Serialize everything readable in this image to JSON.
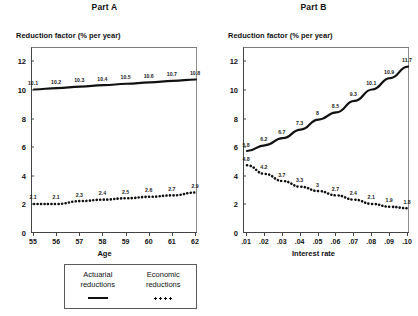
{
  "figure": {
    "y_axis_title": "Reduction factor (% per year)",
    "legend": {
      "actuarial_line1": "Actuarial",
      "actuarial_line2": "reductions",
      "economic_line1": "Economic",
      "economic_line2": "reductions",
      "actuarial_style": "solid-line",
      "economic_style": "dotted-line"
    }
  },
  "chart_data": [
    {
      "type": "line",
      "title": "Part A",
      "xlabel": "Age",
      "ylabel": "Reduction factor (% per year)",
      "categories": [
        "55",
        "56",
        "57",
        "58",
        "59",
        "60",
        "61",
        "62"
      ],
      "xlim": [
        55,
        62
      ],
      "ylim": [
        0,
        13
      ],
      "yticks": [
        "0",
        "2",
        "4",
        "6",
        "8",
        "10",
        "12"
      ],
      "ytick_values": [
        0,
        2,
        4,
        6,
        8,
        10,
        12
      ],
      "grid": false,
      "legend_position": "below-figure",
      "series": [
        {
          "name": "Actuarial reductions",
          "style": "solid",
          "values": [
            10.1,
            10.2,
            10.3,
            10.4,
            10.5,
            10.6,
            10.7,
            10.8
          ],
          "labels": [
            "10.1",
            "10.2",
            "10.3",
            "10.4",
            "10.5",
            "10.6",
            "10.7",
            "10.8"
          ]
        },
        {
          "name": "Economic reductions",
          "style": "dotted",
          "values": [
            2.1,
            2.1,
            2.3,
            2.4,
            2.5,
            2.6,
            2.7,
            2.9
          ],
          "labels": [
            "2.1",
            "2.1",
            "2.3",
            "2.4",
            "2.5",
            "2.6",
            "2.7",
            "2.9"
          ]
        }
      ]
    },
    {
      "type": "line",
      "title": "Part B",
      "xlabel": "Interest rate",
      "ylabel": "Reduction factor (% per year)",
      "categories": [
        ".01",
        ".02",
        ".03",
        ".04",
        ".05",
        ".06",
        ".07",
        ".08",
        ".09",
        ".10"
      ],
      "xlim": [
        0.01,
        0.1
      ],
      "ylim": [
        0,
        13
      ],
      "yticks": [
        "0",
        "2",
        "4",
        "6",
        "8",
        "10",
        "12"
      ],
      "ytick_values": [
        0,
        2,
        4,
        6,
        8,
        10,
        12
      ],
      "grid": false,
      "legend_position": "below-figure",
      "series": [
        {
          "name": "Actuarial reductions",
          "style": "solid",
          "values": [
            5.8,
            6.2,
            6.7,
            7.3,
            8.0,
            8.5,
            9.3,
            10.1,
            10.9,
            11.7
          ],
          "labels": [
            "5.8",
            "6.2",
            "6.7",
            "7.3",
            "8",
            "8.5",
            "9.3",
            "10.1",
            "10.9",
            "11.7"
          ]
        },
        {
          "name": "Economic reductions",
          "style": "dotted",
          "values": [
            4.8,
            4.2,
            3.7,
            3.3,
            3.0,
            2.7,
            2.4,
            2.1,
            1.9,
            1.8
          ],
          "labels": [
            "4.8",
            "4.2",
            "3.7",
            "3.3",
            "3",
            "2.7",
            "2.4",
            "2.1",
            "1.9",
            "1.8"
          ]
        }
      ]
    }
  ]
}
